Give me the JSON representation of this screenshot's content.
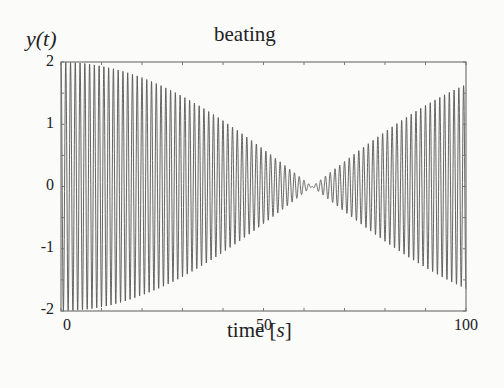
{
  "chart_data": {
    "type": "line",
    "title": "beating",
    "xlabel": "time [s]",
    "xlabel_parts": {
      "prefix": "time [",
      "var": "s",
      "suffix": "]"
    },
    "ylabel": "y(t)",
    "xlim": [
      0,
      100
    ],
    "ylim": [
      -2,
      2
    ],
    "xticks": [
      0,
      50,
      100
    ],
    "yticks": [
      2,
      1,
      0,
      -1,
      -2
    ],
    "minor_xtick_step": 10,
    "minor_ytick_step": 0.5,
    "grid": false,
    "legend": null,
    "series": [
      {
        "name": "y(t) = cos(2π f1 t) + cos(2π f2 t)",
        "description": "Beating signal: rapid carrier oscillation with envelope 2|cos(π Δ t)|, starting at amplitude 2 at t=0, shrinking to a node near t≈62 s, then growing to ≈1.6 at t=100 s",
        "carrier_frequency_hz": 0.85,
        "envelope_node_s": 62,
        "envelope_amplitude_at": [
          {
            "t": 0,
            "amp": 2.0
          },
          {
            "t": 10,
            "amp": 1.94
          },
          {
            "t": 20,
            "amp": 1.74
          },
          {
            "t": 30,
            "amp": 1.42
          },
          {
            "t": 40,
            "amp": 1.04
          },
          {
            "t": 50,
            "amp": 0.6
          },
          {
            "t": 62,
            "amp": 0.0
          },
          {
            "t": 70,
            "amp": 0.4
          },
          {
            "t": 80,
            "amp": 0.88
          },
          {
            "t": 90,
            "amp": 1.31
          },
          {
            "t": 100,
            "amp": 1.64
          }
        ],
        "color": "#555555"
      }
    ]
  },
  "labels": {
    "title": "beating",
    "ylabel": "y(t)",
    "xlabel_prefix": "time [",
    "xlabel_var": "s",
    "xlabel_suffix": "]",
    "yticks": [
      "2",
      "1",
      "0",
      "-1",
      "-2"
    ],
    "xticks": [
      "0",
      "50",
      "100"
    ]
  }
}
